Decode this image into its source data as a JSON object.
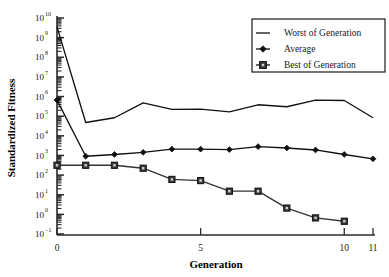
{
  "chart_data": {
    "type": "line",
    "title": "",
    "xlabel": "Generation",
    "ylabel": "Standardized Fitness",
    "yscale": "log",
    "ylim": [
      0.1,
      10000000000
    ],
    "xlim": [
      0,
      11
    ],
    "grid": false,
    "legend_position": "top-right",
    "x": [
      0,
      1,
      2,
      3,
      4,
      5,
      6,
      7,
      8,
      9,
      10,
      11
    ],
    "xtick_labels": [
      "0",
      "5",
      "10",
      "11"
    ],
    "xtick_values": [
      0,
      5,
      10,
      11
    ],
    "ytick_labels": [
      "10⁻¹",
      "10⁰",
      "10¹",
      "10²",
      "10³",
      "10⁴",
      "10⁵",
      "10⁶",
      "10⁷",
      "10⁸",
      "10⁹",
      "10¹⁰"
    ],
    "ytick_exponents": [
      -1,
      0,
      1,
      2,
      3,
      4,
      5,
      6,
      7,
      8,
      9,
      10
    ],
    "series": [
      {
        "name": "Worst of Generation",
        "marker": "none",
        "log_values": [
          9.55,
          4.68,
          4.92,
          5.68,
          5.35,
          5.36,
          5.22,
          5.58,
          5.48,
          5.82,
          5.8,
          4.92
        ],
        "values": [
          3500000000.0,
          47800,
          83000,
          480000,
          224000,
          229000,
          166000,
          380000,
          302000,
          660000,
          631000,
          83000
        ]
      },
      {
        "name": "Average",
        "marker": "diamond",
        "log_values": [
          5.82,
          2.96,
          3.05,
          3.16,
          3.32,
          3.32,
          3.3,
          3.45,
          3.38,
          3.28,
          3.05,
          2.83
        ],
        "values": [
          661000,
          912,
          1122,
          1445,
          2089,
          2089,
          1995,
          2818,
          2399,
          1905,
          1122,
          676
        ]
      },
      {
        "name": "Best of Generation",
        "marker": "square",
        "log_values": [
          2.5,
          2.5,
          2.5,
          2.35,
          1.78,
          1.72,
          1.18,
          1.18,
          0.32,
          -0.18,
          -0.35,
          null
        ],
        "values": [
          316,
          316,
          316,
          224,
          60,
          52,
          15,
          15,
          2.1,
          0.66,
          0.45,
          null
        ]
      }
    ]
  },
  "legend": {
    "items": [
      {
        "label": "Worst of Generation",
        "marker": "line"
      },
      {
        "label": "Average",
        "marker": "diamond"
      },
      {
        "label": "Best of Generation",
        "marker": "square"
      }
    ]
  },
  "axis": {
    "x_title": "Generation",
    "y_title": "Standardized Fitness"
  },
  "colors": {
    "line": "#111111",
    "best_marker_fill": "#cfcfcf",
    "background": "#ffffff"
  }
}
